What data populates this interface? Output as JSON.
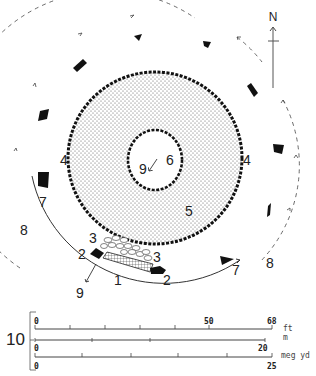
{
  "diagram": {
    "type": "archaeological site plan",
    "north_label": "N",
    "colors": {
      "ink": "#111111",
      "stipple": "#9a9a9a",
      "background": "#ffffff"
    },
    "labels": {
      "l1": "1",
      "l2a": "2",
      "l2b": "2",
      "l3a": "3",
      "l3b": "3",
      "l4a": "4",
      "l4b": "4",
      "l5": "5",
      "l6": "6",
      "l7a": "7",
      "l7b": "7",
      "l8a": "8",
      "l8b": "8",
      "l9a": "9",
      "l9b": "9",
      "l10": "10"
    },
    "features": [
      {
        "key": "1",
        "desc": "recumbent stone (hatched)"
      },
      {
        "key": "2",
        "desc": "flanker stones"
      },
      {
        "key": "3",
        "desc": "rubble / cobbles"
      },
      {
        "key": "4",
        "desc": "ring cairn kerb"
      },
      {
        "key": "5",
        "desc": "cairn (stippled)"
      },
      {
        "key": "6",
        "desc": "central space"
      },
      {
        "key": "7",
        "desc": "circle stones"
      },
      {
        "key": "8",
        "desc": "dashed circuit arrows"
      },
      {
        "key": "9",
        "desc": "direction arrows"
      },
      {
        "key": "10",
        "desc": "scale bars"
      }
    ]
  },
  "scale": {
    "ft": {
      "unit": "ft",
      "start": "0",
      "mid": "50",
      "end": "68"
    },
    "m": {
      "unit": "m",
      "start": "0",
      "end": "20"
    },
    "myd": {
      "unit": "meg yd",
      "start": "0",
      "end": "25"
    }
  }
}
